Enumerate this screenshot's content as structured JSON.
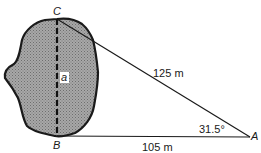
{
  "diagram": {
    "type": "surveying-triangle",
    "points": {
      "C": {
        "label": "C"
      },
      "B": {
        "label": "B"
      },
      "A": {
        "label": "A"
      }
    },
    "segments": {
      "AC": {
        "label": "125 m"
      },
      "AB": {
        "label": "105 m"
      },
      "BC": {
        "label": "a",
        "style": "dashed"
      }
    },
    "angle_A": {
      "label": "31.5°"
    },
    "obstacle": {
      "fill": "#9a9a9a",
      "stroke": "#1a1a1a"
    }
  }
}
